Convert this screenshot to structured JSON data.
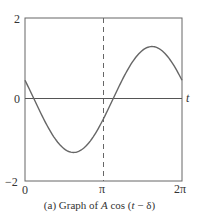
{
  "chart_data": {
    "type": "line",
    "title": "",
    "caption": "(a)  Graph of A cos (t − δ)",
    "xlabel": "t",
    "ylabel": "",
    "xlim": [
      0,
      6.2832
    ],
    "ylim": [
      -2,
      2
    ],
    "x_ticks": [
      {
        "value": 0,
        "label": "0"
      },
      {
        "value": 3.1416,
        "label": "π"
      },
      {
        "value": 6.2832,
        "label": "2π"
      }
    ],
    "y_ticks": [
      {
        "value": 2,
        "label": "2"
      },
      {
        "value": 0,
        "label": "0"
      },
      {
        "value": -2,
        "label": "−2"
      }
    ],
    "reference_lines": [
      {
        "orientation": "vertical",
        "x": 3.1416,
        "style": "dashed"
      },
      {
        "orientation": "horizontal",
        "y": 0,
        "style": "solid"
      }
    ],
    "grid": false,
    "legend": null,
    "function": "A cos(t − δ)",
    "parameters_estimated": {
      "A": 1.3,
      "delta": -1.2
    },
    "series": [
      {
        "name": "A cos(t − δ)",
        "x": [
          0,
          0.5,
          1.0,
          1.5,
          2.0,
          2.5,
          3.0,
          3.5,
          4.0,
          4.5,
          5.0,
          5.5,
          6.0,
          6.2832
        ],
        "values": [
          0.47,
          -0.13,
          -0.72,
          -1.15,
          -1.3,
          -1.13,
          -0.69,
          -0.09,
          0.51,
          1.01,
          1.3,
          1.27,
          0.95,
          0.47
        ]
      }
    ]
  },
  "labels": {
    "y_top": "2",
    "y_zero": "0",
    "y_bottom": "−2",
    "x_zero": "0",
    "x_pi": "π",
    "x_two_pi": "2π",
    "t_axis": "t",
    "caption_prefix": "(a)  Graph of ",
    "caption_A": "A",
    "caption_cos": " cos (",
    "caption_t": "t",
    "caption_suffix": " − δ)"
  },
  "colors": {
    "frame": "#555555",
    "curve": "#666666",
    "axis": "#444444",
    "dashed": "#555555"
  }
}
